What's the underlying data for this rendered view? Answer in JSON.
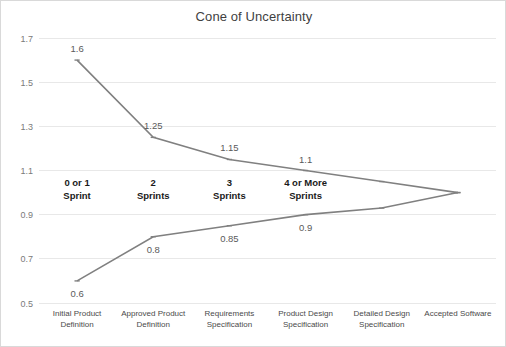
{
  "chart_data": {
    "type": "line",
    "title": "Cone of Uncertainty",
    "xlabel": "",
    "ylabel": "",
    "ylim": [
      0.5,
      1.7
    ],
    "yticks": [
      0.5,
      0.7,
      0.9,
      1.1,
      1.3,
      1.5,
      1.7
    ],
    "ytick_labels": [
      "0.5",
      "0.7",
      "0.9",
      "1.1",
      "1.3",
      "1.5",
      "1.7"
    ],
    "grid": true,
    "legend": "none",
    "categories": [
      "Initial Product Definition",
      "Approved Product Definition",
      "Requirements Specification",
      "Product Design Specification",
      "Detailed Design Specification",
      "Accepted Software"
    ],
    "category_lines": [
      [
        "Initial Product",
        "Definition"
      ],
      [
        "Approved Product",
        "Definition"
      ],
      [
        "Requirements",
        "Specification"
      ],
      [
        "Product Design",
        "Specification"
      ],
      [
        "Detailed Design",
        "Specification"
      ],
      [
        "Accepted Software"
      ]
    ],
    "series": [
      {
        "name": "Upper Bound",
        "values": [
          1.6,
          1.25,
          1.15,
          1.1,
          1.05,
          1.0
        ],
        "point_labels": [
          "1.6",
          "1.25",
          "1.15",
          "1.1",
          "",
          ""
        ],
        "color": "#808080"
      },
      {
        "name": "Lower Bound",
        "values": [
          0.6,
          0.8,
          0.85,
          0.9,
          0.93,
          1.0
        ],
        "point_labels": [
          "0.6",
          "0.8",
          "0.85",
          "0.9",
          "",
          ""
        ],
        "color": "#808080"
      }
    ],
    "annotations": [
      {
        "lines": [
          "0 or 1",
          "Sprint"
        ],
        "category_index": 0
      },
      {
        "lines": [
          "2",
          "Sprints"
        ],
        "category_index": 1
      },
      {
        "lines": [
          "3",
          "Sprints"
        ],
        "category_index": 2
      },
      {
        "lines": [
          "4 or More",
          "Sprints"
        ],
        "category_index": 3
      }
    ],
    "colors": {
      "line": "#808080",
      "grid": "#e8e8e8",
      "title": "#3f3f3f",
      "tick": "#7a7a7a",
      "annotation": "#1a1a1a",
      "background": "#ffffff"
    }
  }
}
